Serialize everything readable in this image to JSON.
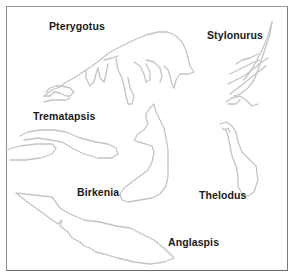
{
  "diagram": {
    "type": "labeled-illustration",
    "labels": [
      {
        "id": "pterygotus",
        "text": "Pterygotus",
        "x": 49,
        "y": 20
      },
      {
        "id": "stylonurus",
        "text": "Stylonurus",
        "x": 207,
        "y": 29
      },
      {
        "id": "trematapsis",
        "text": "Trematapsis",
        "x": 33,
        "y": 110
      },
      {
        "id": "birkenia",
        "text": "Birkenia",
        "x": 77,
        "y": 186
      },
      {
        "id": "thelodus",
        "text": "Thelodus",
        "x": 199,
        "y": 189
      },
      {
        "id": "anglaspis",
        "text": "Anglaspis",
        "x": 168,
        "y": 236
      }
    ],
    "colors": {
      "outline": "#c4c4c4",
      "label": "#1a1a1a",
      "frame": "#7a7a7a",
      "background": "#ffffff"
    }
  }
}
